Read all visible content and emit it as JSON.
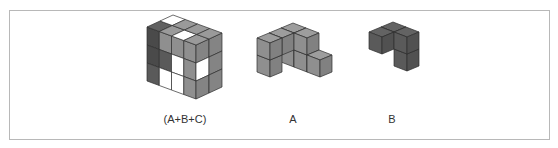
{
  "labels": {
    "combined": "(A+B+C)",
    "a": "A",
    "b": "B"
  },
  "colors": {
    "border": "#b8b8b8",
    "edge": "#2e2e2e",
    "white": "#ffffff",
    "light": "#8f8f8f",
    "mid": "#7a7a7a",
    "dark": "#5a5a5a",
    "darker": "#4a4a4a",
    "text": "#333333"
  },
  "figures": {
    "combined": {
      "origin": [
        147,
        81
      ],
      "u": [
        12.25,
        4.5
      ],
      "v": [
        13,
        -6
      ],
      "w": [
        0,
        -18
      ],
      "size": [
        4,
        2,
        3
      ],
      "front_face": [
        [
          "darker",
          "light",
          "light",
          "light"
        ],
        [
          "darker",
          "dark",
          "white",
          "light"
        ],
        [
          "dark",
          "white",
          "white",
          "light"
        ]
      ],
      "side_face": [
        [
          "light",
          "light"
        ],
        [
          "white",
          "light"
        ],
        [
          "light",
          "light"
        ]
      ],
      "top_face": [
        [
          "white",
          "dark"
        ],
        [
          "light",
          "light"
        ],
        [
          "light",
          "white"
        ],
        [
          "light",
          "light"
        ]
      ]
    },
    "a": {
      "origin": [
        257,
        72
      ],
      "a": [
        13,
        5
      ],
      "b": [
        12,
        -5
      ],
      "c": [
        0,
        -17
      ],
      "cubes": [
        [
          0,
          2,
          0
        ],
        [
          0,
          2,
          1
        ],
        [
          0,
          1,
          1
        ],
        [
          0,
          0,
          1
        ],
        [
          0,
          0,
          0
        ],
        [
          1,
          2,
          0
        ],
        [
          1,
          2,
          1
        ],
        [
          2,
          2,
          0
        ]
      ],
      "shade": "light"
    },
    "b": {
      "origin": [
        369,
        66
      ],
      "a": [
        13,
        5
      ],
      "b": [
        12,
        -5
      ],
      "c": [
        0,
        -17
      ],
      "cubes": [
        [
          0,
          1,
          1
        ],
        [
          0,
          0,
          1
        ],
        [
          1,
          1,
          0
        ],
        [
          1,
          1,
          1
        ]
      ],
      "shade": "dark"
    }
  }
}
